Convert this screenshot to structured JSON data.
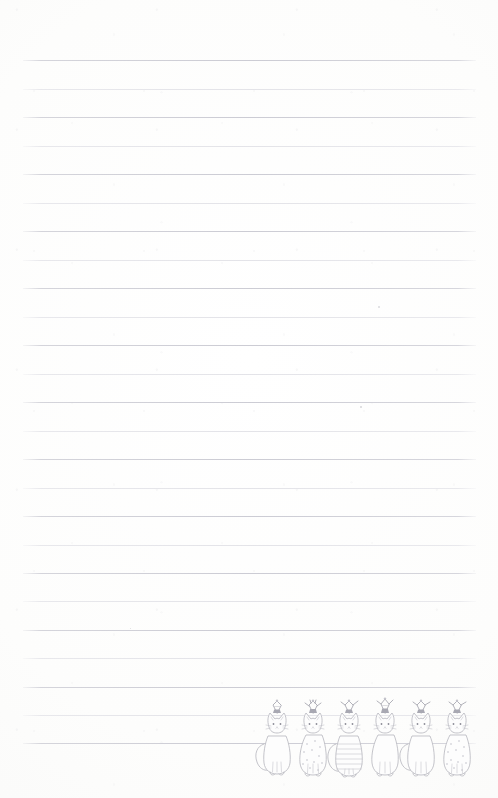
{
  "page": {
    "kind": "lined-notepad-page",
    "width": 498,
    "height": 798,
    "background_color": "#fcfcfb",
    "paper_tint": "#fdfdfc"
  },
  "ruling": {
    "line_color_light": "#e2e2e7",
    "line_color_dark": "#ccccd4",
    "line_left_x": 23,
    "line_right_x": 476,
    "line_width": 453,
    "first_line_y": 60,
    "line_spacing": 28.6,
    "line_count": 24,
    "lines": [
      {
        "index": 1,
        "y": 60,
        "weight": "dark"
      },
      {
        "index": 2,
        "y": 89,
        "weight": "light"
      },
      {
        "index": 3,
        "y": 117,
        "weight": "dark"
      },
      {
        "index": 4,
        "y": 146,
        "weight": "light"
      },
      {
        "index": 5,
        "y": 174,
        "weight": "dark"
      },
      {
        "index": 6,
        "y": 203,
        "weight": "light"
      },
      {
        "index": 7,
        "y": 231,
        "weight": "dark"
      },
      {
        "index": 8,
        "y": 260,
        "weight": "light"
      },
      {
        "index": 9,
        "y": 288,
        "weight": "dark"
      },
      {
        "index": 10,
        "y": 317,
        "weight": "light"
      },
      {
        "index": 11,
        "y": 345,
        "weight": "dark"
      },
      {
        "index": 12,
        "y": 374,
        "weight": "light"
      },
      {
        "index": 13,
        "y": 402,
        "weight": "dark"
      },
      {
        "index": 14,
        "y": 431,
        "weight": "light"
      },
      {
        "index": 15,
        "y": 459,
        "weight": "dark"
      },
      {
        "index": 16,
        "y": 488,
        "weight": "light"
      },
      {
        "index": 17,
        "y": 516,
        "weight": "dark"
      },
      {
        "index": 18,
        "y": 545,
        "weight": "light"
      },
      {
        "index": 19,
        "y": 573,
        "weight": "dark"
      },
      {
        "index": 20,
        "y": 601,
        "weight": "light"
      },
      {
        "index": 21,
        "y": 630,
        "weight": "dark"
      },
      {
        "index": 22,
        "y": 658,
        "weight": "light"
      },
      {
        "index": 23,
        "y": 687,
        "weight": "dark"
      },
      {
        "index": 24,
        "y": 715,
        "weight": "light"
      },
      {
        "index": 25,
        "y": 743,
        "weight": "dark"
      }
    ]
  },
  "specks": [
    {
      "x": 378,
      "y": 306,
      "size": 2.0
    },
    {
      "x": 360,
      "y": 406,
      "size": 1.6
    },
    {
      "x": 130,
      "y": 628,
      "size": 1.4
    }
  ],
  "illustration": {
    "name": "party-hat-cats",
    "description": "Six hand-drawn sitting cats wearing party hats, pencil line art",
    "bounds": {
      "x": 252,
      "y": 700,
      "width": 232,
      "height": 80
    },
    "stroke_color": "#b9b9c0",
    "detail_color": "#c6c6cc",
    "hat_color": "#a8a8b2",
    "cat_count": 6,
    "cats": [
      {
        "index": 1,
        "pattern": "plain",
        "facing": "front",
        "tail": "left",
        "hat": "cone-dark"
      },
      {
        "index": 2,
        "pattern": "dotted",
        "facing": "front",
        "tail": "right",
        "hat": "cone-fringe"
      },
      {
        "index": 3,
        "pattern": "striped",
        "facing": "front",
        "tail": "left",
        "hat": "cone-dark"
      },
      {
        "index": 4,
        "pattern": "plain",
        "facing": "front",
        "tail": "right",
        "hat": "cone-tall"
      },
      {
        "index": 5,
        "pattern": "plain",
        "facing": "front",
        "tail": "left",
        "hat": "cone-dark"
      },
      {
        "index": 6,
        "pattern": "dotted",
        "facing": "front",
        "tail": "right",
        "hat": "cone-dark"
      }
    ]
  }
}
